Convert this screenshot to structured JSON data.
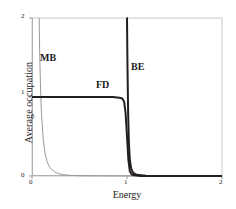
{
  "chart_data": {
    "type": "line",
    "title": "",
    "xlabel": "Energy",
    "ylabel": "Average occupation",
    "xlim": [
      0,
      2
    ],
    "ylim": [
      0,
      2
    ],
    "xticks": [
      "0",
      "1",
      "2"
    ],
    "yticks": [
      "0",
      "1",
      "2"
    ],
    "xtick_values": [
      0,
      1,
      2
    ],
    "ytick_values": [
      0,
      1,
      2
    ],
    "grid": false,
    "legend_position": "inline-annotations",
    "series": [
      {
        "name": "MB",
        "label": "MB",
        "description": "Maxwell-Boltzmann distribution: exponential decay, diverges above the top of the plot near E=0.08",
        "color": "#999999",
        "linewidth": 1.0,
        "x": [
          0.075,
          0.08,
          0.09,
          0.1,
          0.12,
          0.14,
          0.16,
          0.18,
          0.2,
          0.24,
          0.28,
          0.32,
          0.38,
          0.45,
          0.55,
          0.7,
          0.9,
          1.2,
          1.6,
          2.0
        ],
        "y": [
          2.0,
          1.62,
          1.1,
          0.78,
          0.44,
          0.27,
          0.18,
          0.125,
          0.09,
          0.05,
          0.03,
          0.019,
          0.01,
          0.005,
          0.002,
          0.001,
          0.0,
          0.0,
          0.0,
          0.0
        ]
      },
      {
        "name": "FD",
        "label": "FD",
        "description": "Fermi-Dirac distribution: plateau at occupation 1 up to the Fermi energy E=1, then a sharp step down to 0",
        "color": "#231f20",
        "linewidth": 2.0,
        "x": [
          0.0,
          0.4,
          0.7,
          0.85,
          0.92,
          0.95,
          0.97,
          0.985,
          1.0,
          1.015,
          1.03,
          1.05,
          1.08,
          1.15,
          1.4,
          1.7,
          2.0
        ],
        "y": [
          1.0,
          1.0,
          1.0,
          1.0,
          0.99,
          0.98,
          0.94,
          0.8,
          0.5,
          0.2,
          0.06,
          0.02,
          0.01,
          0.0,
          0.0,
          0.0,
          0.0
        ]
      },
      {
        "name": "BE",
        "label": "BE",
        "description": "Bose-Einstein distribution: diverges at E=1, rising off the top of the plot, and falls abruptly to 0 just above E=1",
        "color": "#231f20",
        "linewidth": 2.0,
        "x": [
          0.998,
          1.0,
          1.005,
          1.012,
          1.02,
          1.03,
          1.045,
          1.065,
          1.1,
          1.2,
          1.45,
          1.75,
          2.0
        ],
        "y": [
          2.0,
          2.0,
          1.4,
          0.8,
          0.42,
          0.2,
          0.09,
          0.04,
          0.015,
          0.003,
          0.0,
          0.0,
          0.0
        ]
      }
    ],
    "annotations": [
      {
        "text": "MB",
        "x": 0.1,
        "y": 1.55
      },
      {
        "text": "FD",
        "x": 0.7,
        "y": 1.15
      },
      {
        "text": "BE",
        "x": 1.05,
        "y": 1.4
      }
    ],
    "colors": {
      "mb": "#999999",
      "fd": "#231f20",
      "be": "#231f20",
      "frame": "#c8c8c8",
      "text": "#1a1a1a",
      "background": "#ffffff"
    }
  },
  "axes": {
    "x": {
      "label": "Energy",
      "tick_0": "0",
      "tick_1": "1",
      "tick_2": "2"
    },
    "y": {
      "label": "Average occupation",
      "tick_0": "0",
      "tick_1": "1",
      "tick_2": "2"
    }
  },
  "annotations": {
    "mb": "MB",
    "fd": "FD",
    "be": "BE"
  }
}
